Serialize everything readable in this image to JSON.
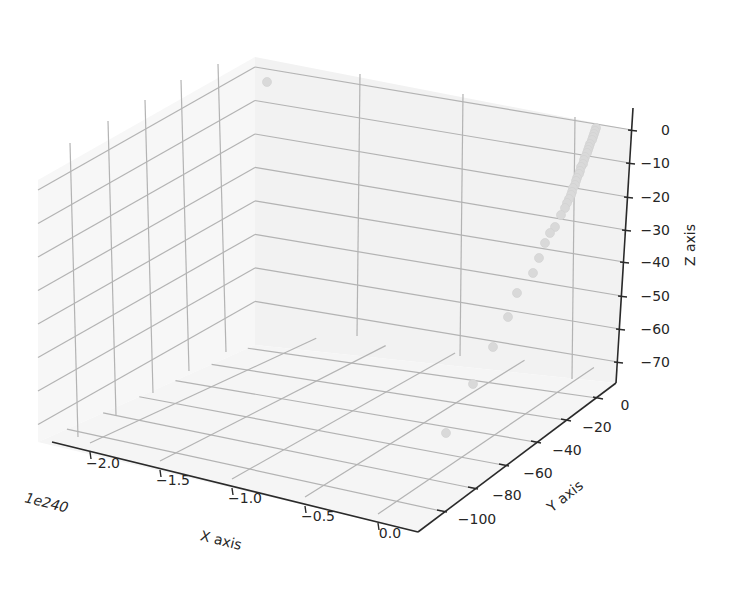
{
  "chart_data": {
    "type": "scatter",
    "projection": "3d",
    "title": "",
    "xlabel": "X axis",
    "ylabel": "Y axis",
    "zlabel": "Z axis",
    "x_offset_text": "1e240",
    "x_ticks": [
      "−2.0",
      "−1.5",
      "−1.0",
      "−0.5",
      "0.0"
    ],
    "y_ticks": [
      "0",
      "−20",
      "−40",
      "−60",
      "−80",
      "−100"
    ],
    "z_ticks": [
      "0",
      "−10",
      "−20",
      "−30",
      "−40",
      "−50",
      "−60",
      "−70"
    ],
    "xlim": [
      -2.3e+240,
      1e+239
    ],
    "ylim": [
      -110,
      5
    ],
    "zlim": [
      -76,
      3
    ],
    "grid": true,
    "marker_color": "#d9d9d9",
    "points": [
      {
        "x": -2.2e+240,
        "y": 0,
        "z": 0
      },
      {
        "x": 0,
        "y": 0,
        "z": 0
      },
      {
        "x": 0,
        "y": -1,
        "z": -1
      },
      {
        "x": 0,
        "y": -2,
        "z": -2
      },
      {
        "x": 0,
        "y": -3,
        "z": -3
      },
      {
        "x": 0,
        "y": -4,
        "z": -4
      },
      {
        "x": 0,
        "y": -5,
        "z": -5
      },
      {
        "x": 0,
        "y": -6,
        "z": -6
      },
      {
        "x": 0,
        "y": -7,
        "z": -7
      },
      {
        "x": 0,
        "y": -8,
        "z": -8
      },
      {
        "x": 0,
        "y": -9,
        "z": -9
      },
      {
        "x": 0,
        "y": -10,
        "z": -10
      },
      {
        "x": 0,
        "y": -11,
        "z": -11
      },
      {
        "x": 0,
        "y": -12,
        "z": -12
      },
      {
        "x": 0,
        "y": -13,
        "z": -13
      },
      {
        "x": 0,
        "y": -14,
        "z": -14
      },
      {
        "x": 0,
        "y": -15,
        "z": -15
      },
      {
        "x": 0,
        "y": -16,
        "z": -16
      },
      {
        "x": 0,
        "y": -17,
        "z": -17
      },
      {
        "x": 0,
        "y": -18,
        "z": -18
      },
      {
        "x": 0,
        "y": -19,
        "z": -19
      },
      {
        "x": 0,
        "y": -20,
        "z": -20
      },
      {
        "x": 0,
        "y": -21,
        "z": -21
      },
      {
        "x": 0,
        "y": -22,
        "z": -22
      },
      {
        "x": 0,
        "y": -24,
        "z": -24
      },
      {
        "x": 0,
        "y": -27,
        "z": -27
      },
      {
        "x": 0,
        "y": -30,
        "z": -30
      },
      {
        "x": 0,
        "y": -35,
        "z": -35
      },
      {
        "x": 0,
        "y": -42,
        "z": -42
      },
      {
        "x": 0,
        "y": -50,
        "z": -50
      },
      {
        "x": 0,
        "y": -62,
        "z": -62
      },
      {
        "x": 0,
        "y": -80,
        "z": -70
      },
      {
        "x": 0,
        "y": -105,
        "z": -75
      }
    ]
  },
  "labels": {
    "x_axis": "X axis",
    "y_axis": "Y axis",
    "z_axis": "Z axis",
    "x_offset": "1e240"
  }
}
